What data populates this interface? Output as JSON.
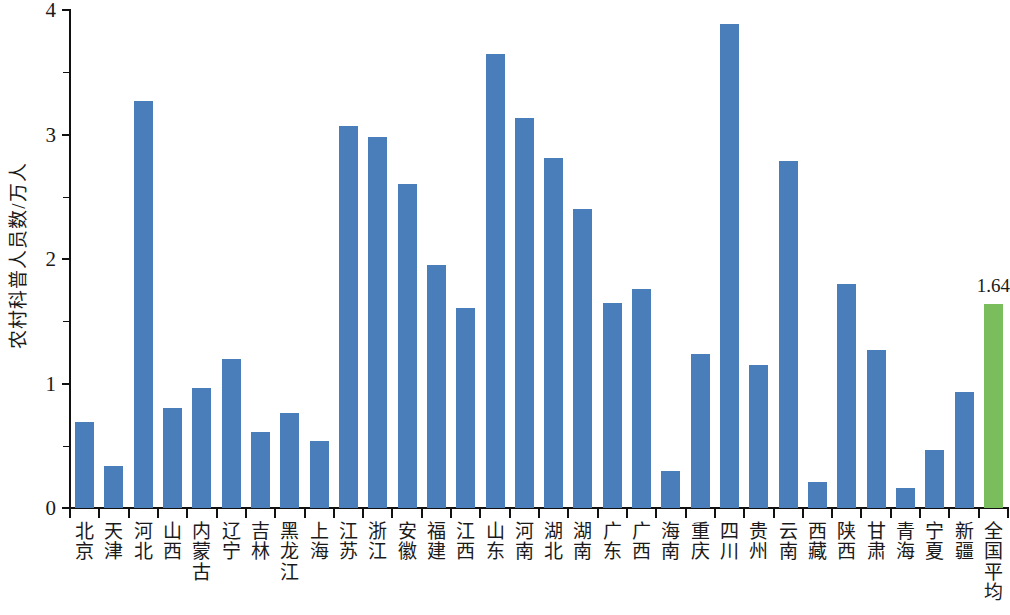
{
  "chart_data": {
    "type": "bar",
    "title": "",
    "xlabel": "",
    "ylabel": "农村科普人员数/万人",
    "ylim": [
      0,
      4
    ],
    "yticks": [
      "0",
      "1",
      "2",
      "3",
      "4"
    ],
    "grid": false,
    "legend": null,
    "colors": {
      "bar": "#4a7ebb",
      "accent_bar": "#79bd5c",
      "axis": "#111111",
      "text": "#1a1a1a"
    },
    "categories": [
      "北京",
      "天津",
      "河北",
      "山西",
      "内蒙古",
      "辽宁",
      "吉林",
      "黑龙江",
      "上海",
      "江苏",
      "浙江",
      "安徽",
      "福建",
      "江西",
      "山东",
      "河南",
      "湖北",
      "湖南",
      "广东",
      "广西",
      "海南",
      "重庆",
      "四川",
      "贵州",
      "云南",
      "西藏",
      "陕西",
      "甘肃",
      "青海",
      "宁夏",
      "新疆",
      "全国平均"
    ],
    "values": [
      0.69,
      0.34,
      3.27,
      0.8,
      0.96,
      1.2,
      0.61,
      0.76,
      0.54,
      3.07,
      2.98,
      2.6,
      1.95,
      1.61,
      3.65,
      3.13,
      2.81,
      2.4,
      1.65,
      1.76,
      0.3,
      1.24,
      3.89,
      1.15,
      2.79,
      0.21,
      1.8,
      1.27,
      0.16,
      0.47,
      0.93,
      1.64
    ],
    "accent_index": 31,
    "data_labels": {
      "31": "1.64"
    }
  }
}
